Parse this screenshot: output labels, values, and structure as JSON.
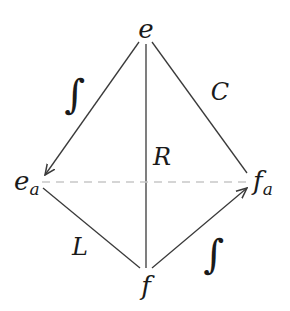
{
  "diagram": {
    "nodes": {
      "top": {
        "base": "e",
        "sub": ""
      },
      "left": {
        "base": "e",
        "sub": "a"
      },
      "right": {
        "base": "f",
        "sub": "a"
      },
      "bottom": {
        "base": "f",
        "sub": ""
      }
    },
    "edges": {
      "top_to_left": {
        "label": "∫",
        "arrow": "to-left"
      },
      "top_to_right": {
        "label": "C",
        "arrow": "none"
      },
      "top_to_bottom": {
        "label": "R",
        "arrow": "none"
      },
      "left_to_bottom": {
        "label": "L",
        "arrow": "none"
      },
      "bottom_to_right": {
        "label": "∫",
        "arrow": "to-right"
      },
      "left_to_right": {
        "label": "",
        "style": "dashed"
      }
    },
    "colors": {
      "line": "#3a3a3a",
      "dashed": "#c8c8c8",
      "text": "#1a1a1a",
      "background": "#ffffff"
    }
  }
}
